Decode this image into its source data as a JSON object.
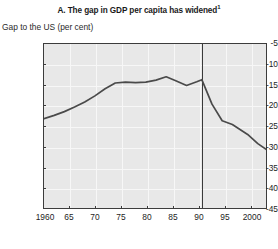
{
  "chart_data": {
    "type": "line",
    "title": "A. The gap in GDP per capita has widened",
    "title_footnote_marker": "1",
    "subtitle": "",
    "ylabel": "Gap to the US (per cent)",
    "xlabel": "",
    "ylim": [
      -45,
      -5
    ],
    "xlim": [
      1960,
      2004
    ],
    "grid": true,
    "legend": "none",
    "yticks": [
      -5,
      -10,
      -15,
      -20,
      -25,
      -30,
      -35,
      -40,
      -45
    ],
    "ytick_labels": [
      "-5",
      "-10",
      "-15",
      "-20",
      "-25",
      "-30",
      "-35",
      "-40",
      "-45"
    ],
    "xticks": [
      1960,
      1965,
      1970,
      1975,
      1980,
      1985,
      1990,
      1995,
      2000
    ],
    "xtick_labels": [
      "1960",
      "65",
      "70",
      "75",
      "80",
      "85",
      "90",
      "95",
      "2000"
    ],
    "annotations": [
      {
        "name": "reunification-reference-line",
        "type": "vertical-line",
        "x": 1991,
        "label": ""
      }
    ],
    "series": [
      {
        "name": "Gap to the US (per cent)",
        "color": "#4a4a4a",
        "x": [
          1960,
          1962,
          1964,
          1966,
          1968,
          1970,
          1972,
          1974,
          1976,
          1978,
          1980,
          1982,
          1984,
          1986,
          1988,
          1990,
          1991,
          1993,
          1995,
          1997,
          2000,
          2002,
          2004
        ],
        "values": [
          -23.0,
          -22.2,
          -21.3,
          -20.2,
          -19.0,
          -17.5,
          -15.8,
          -14.4,
          -14.2,
          -14.3,
          -14.2,
          -13.7,
          -12.9,
          -13.9,
          -15.0,
          -14.1,
          -13.6,
          -19.5,
          -23.5,
          -24.4,
          -26.8,
          -29.0,
          -30.7
        ]
      }
    ]
  },
  "colors": {
    "line": "#4a4a4a",
    "plot_background": "#e8e8e8",
    "gridline": "#f7f7f7",
    "frame": "#3c3c3c",
    "reference_line": "#3a3a3a",
    "text": "#1a1a1a"
  }
}
